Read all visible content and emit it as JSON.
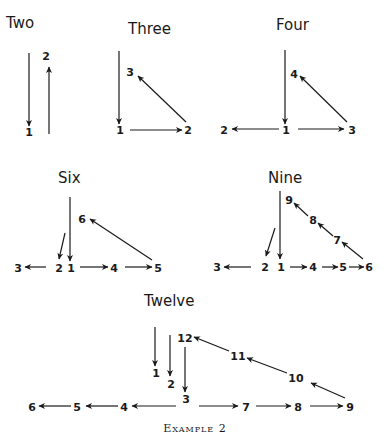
{
  "caption": "Example 2",
  "diagrams": [
    {
      "id": "two",
      "title": "Two",
      "title_pos": [
        6,
        28
      ],
      "nodes": [
        {
          "label": "1",
          "x": 29,
          "y": 136
        },
        {
          "label": "2",
          "x": 46,
          "y": 60
        }
      ],
      "edges": [
        {
          "from": [
            29,
            53
          ],
          "to": [
            29,
            126
          ]
        },
        {
          "from": [
            49,
            134
          ],
          "to": [
            49,
            67
          ]
        }
      ]
    },
    {
      "id": "three",
      "title": "Three",
      "title_pos": [
        128,
        34
      ],
      "nodes": [
        {
          "label": "1",
          "x": 120,
          "y": 134
        },
        {
          "label": "2",
          "x": 188,
          "y": 134
        },
        {
          "label": "3",
          "x": 130,
          "y": 76
        }
      ],
      "edges": [
        {
          "from": [
            119,
            51
          ],
          "to": [
            119,
            124
          ]
        },
        {
          "from": [
            130,
            130
          ],
          "to": [
            182,
            130
          ]
        },
        {
          "from": [
            186,
            122
          ],
          "to": [
            138,
            76
          ]
        }
      ]
    },
    {
      "id": "four",
      "title": "Four",
      "title_pos": [
        276,
        30
      ],
      "nodes": [
        {
          "label": "1",
          "x": 286,
          "y": 134
        },
        {
          "label": "2",
          "x": 224,
          "y": 134
        },
        {
          "label": "3",
          "x": 352,
          "y": 134
        },
        {
          "label": "4",
          "x": 294,
          "y": 78
        }
      ],
      "edges": [
        {
          "from": [
            285,
            50
          ],
          "to": [
            285,
            124
          ]
        },
        {
          "from": [
            279,
            129
          ],
          "to": [
            232,
            129
          ]
        },
        {
          "from": [
            298,
            129
          ],
          "to": [
            344,
            129
          ]
        },
        {
          "from": [
            347,
            122
          ],
          "to": [
            300,
            76
          ]
        }
      ]
    },
    {
      "id": "six",
      "title": "Six",
      "title_pos": [
        58,
        183
      ],
      "nodes": [
        {
          "label": "1",
          "x": 71,
          "y": 272
        },
        {
          "label": "2",
          "x": 59,
          "y": 272
        },
        {
          "label": "3",
          "x": 18,
          "y": 272
        },
        {
          "label": "4",
          "x": 114,
          "y": 272
        },
        {
          "label": "5",
          "x": 158,
          "y": 272
        },
        {
          "label": "6",
          "x": 82,
          "y": 223
        }
      ],
      "edges": [
        {
          "from": [
            70,
            197
          ],
          "to": [
            70,
            261
          ]
        },
        {
          "from": [
            65,
            233
          ],
          "to": [
            59,
            259
          ]
        },
        {
          "from": [
            46,
            267
          ],
          "to": [
            25,
            267
          ]
        },
        {
          "from": [
            80,
            267
          ],
          "to": [
            108,
            267
          ]
        },
        {
          "from": [
            125,
            267
          ],
          "to": [
            152,
            267
          ]
        },
        {
          "from": [
            152,
            260
          ],
          "to": [
            90,
            219
          ]
        }
      ]
    },
    {
      "id": "nine",
      "title": "Nine",
      "title_pos": [
        268,
        183
      ],
      "nodes": [
        {
          "label": "1",
          "x": 281,
          "y": 271
        },
        {
          "label": "2",
          "x": 265,
          "y": 271
        },
        {
          "label": "3",
          "x": 217,
          "y": 271
        },
        {
          "label": "4",
          "x": 313,
          "y": 271
        },
        {
          "label": "5",
          "x": 343,
          "y": 271
        },
        {
          "label": "6",
          "x": 369,
          "y": 271
        },
        {
          "label": "7",
          "x": 337,
          "y": 244
        },
        {
          "label": "8",
          "x": 313,
          "y": 224
        },
        {
          "label": "9",
          "x": 289,
          "y": 204
        }
      ],
      "edges": [
        {
          "from": [
            280,
            191
          ],
          "to": [
            280,
            259
          ]
        },
        {
          "from": [
            275,
            228
          ],
          "to": [
            266,
            256
          ]
        },
        {
          "from": [
            251,
            267
          ],
          "to": [
            224,
            267
          ]
        },
        {
          "from": [
            290,
            267
          ],
          "to": [
            307,
            267
          ]
        },
        {
          "from": [
            322,
            267
          ],
          "to": [
            338,
            267
          ]
        },
        {
          "from": [
            349,
            267
          ],
          "to": [
            364,
            267
          ]
        },
        {
          "from": [
            363,
            259
          ],
          "to": [
            342,
            242
          ]
        },
        {
          "from": [
            333,
            236
          ],
          "to": [
            318,
            223
          ]
        },
        {
          "from": [
            308,
            216
          ],
          "to": [
            294,
            203
          ]
        }
      ]
    },
    {
      "id": "twelve",
      "title": "Twelve",
      "title_pos": [
        144,
        306
      ],
      "nodes": [
        {
          "label": "1",
          "x": 156,
          "y": 377
        },
        {
          "label": "2",
          "x": 171,
          "y": 388
        },
        {
          "label": "3",
          "x": 186,
          "y": 403
        },
        {
          "label": "4",
          "x": 124,
          "y": 411
        },
        {
          "label": "5",
          "x": 77,
          "y": 411
        },
        {
          "label": "6",
          "x": 32,
          "y": 411
        },
        {
          "label": "7",
          "x": 246,
          "y": 411
        },
        {
          "label": "8",
          "x": 298,
          "y": 411
        },
        {
          "label": "9",
          "x": 350,
          "y": 411
        },
        {
          "label": "10",
          "x": 296,
          "y": 382
        },
        {
          "label": "11",
          "x": 238,
          "y": 360
        },
        {
          "label": "12",
          "x": 185,
          "y": 342
        }
      ],
      "edges": [
        {
          "from": [
            155,
            327
          ],
          "to": [
            155,
            366
          ]
        },
        {
          "from": [
            170,
            335
          ],
          "to": [
            170,
            376
          ]
        },
        {
          "from": [
            185,
            347
          ],
          "to": [
            185,
            392
          ]
        },
        {
          "from": [
            176,
            406
          ],
          "to": [
            132,
            406
          ]
        },
        {
          "from": [
            118,
            406
          ],
          "to": [
            86,
            406
          ]
        },
        {
          "from": [
            71,
            406
          ],
          "to": [
            39,
            406
          ]
        },
        {
          "from": [
            199,
            406
          ],
          "to": [
            238,
            406
          ]
        },
        {
          "from": [
            256,
            406
          ],
          "to": [
            291,
            406
          ]
        },
        {
          "from": [
            310,
            406
          ],
          "to": [
            343,
            406
          ]
        },
        {
          "from": [
            345,
            398
          ],
          "to": [
            311,
            383
          ]
        },
        {
          "from": [
            287,
            373
          ],
          "to": [
            247,
            358
          ]
        },
        {
          "from": [
            229,
            351
          ],
          "to": [
            194,
            337
          ]
        }
      ]
    }
  ]
}
